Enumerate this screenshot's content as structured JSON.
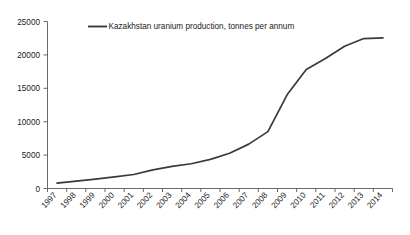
{
  "chart_data": {
    "type": "line",
    "title": "",
    "xlabel": "",
    "ylabel": "",
    "categories": [
      "1997",
      "1998",
      "1999",
      "2000",
      "2001",
      "2002",
      "2003",
      "2004",
      "2005",
      "2006",
      "2007",
      "2008",
      "2009",
      "2010",
      "2011",
      "2012",
      "2013",
      "2014"
    ],
    "series": [
      {
        "name": "Kazakhstan uranium production, tonnes per annum",
        "values": [
          800,
          1100,
          1400,
          1750,
          2100,
          2800,
          3300,
          3700,
          4360,
          5280,
          6640,
          8520,
          14020,
          17800,
          19450,
          21300,
          22450,
          22550
        ],
        "color": "#3a3a3a"
      }
    ],
    "ylim": [
      0,
      25000
    ],
    "yticks": [
      0,
      5000,
      10000,
      15000,
      20000,
      25000
    ],
    "ytick_labels": [
      "0",
      "5000",
      "10000",
      "15000",
      "20000",
      "25000"
    ],
    "grid": false,
    "legend_position": "top-left-inside",
    "legend_entries": [
      "Kazakhstan uranium production, tonnes per annum"
    ]
  },
  "legend": {
    "label": "Kazakhstan uranium production, tonnes per annum"
  },
  "axes": {
    "y_tick_0": "0",
    "y_tick_1": "5000",
    "y_tick_2": "10000",
    "y_tick_3": "15000",
    "y_tick_4": "20000",
    "y_tick_5": "25000"
  },
  "caption": {
    "clipped_text": ""
  }
}
